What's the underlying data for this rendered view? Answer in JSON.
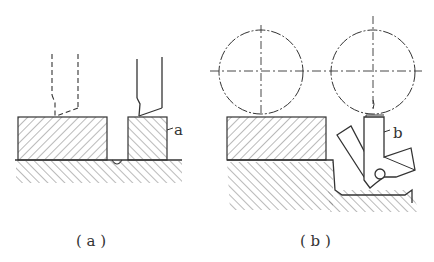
{
  "figure": {
    "panels": [
      {
        "id": "a",
        "caption": "( a )",
        "part_label": "a"
      },
      {
        "id": "b",
        "caption": "( b )",
        "part_label": "b"
      }
    ],
    "colors": {
      "line": "#333333",
      "hatch": "#555555",
      "background": "#ffffff"
    }
  }
}
